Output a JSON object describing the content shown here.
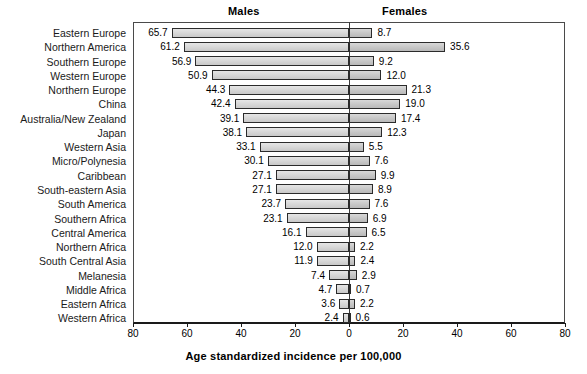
{
  "header": {
    "males_label": "Males",
    "females_label": "Females"
  },
  "axis": {
    "title": "Age standardized incidence per 100,000",
    "ticks": [
      "80",
      "60",
      "40",
      "20",
      "0",
      "20",
      "40",
      "60",
      "80"
    ]
  },
  "chart_data": {
    "type": "bar",
    "subtype": "population-pyramid",
    "title": "",
    "xlabel": "Age standardized incidence per 100,000",
    "ylabel": "",
    "xlim": [
      -80,
      80
    ],
    "grid": false,
    "legend": [
      "Males",
      "Females"
    ],
    "legend_position": "top",
    "categories": [
      "Eastern Europe",
      "Northern America",
      "Southern Europe",
      "Western Europe",
      "Northern Europe",
      "China",
      "Australia/New Zealand",
      "Japan",
      "Western Asia",
      "Micro/Polynesia",
      "Caribbean",
      "South-eastern Asia",
      "South America",
      "Southern Africa",
      "Central America",
      "Northern Africa",
      "South Central Asia",
      "Melanesia",
      "Middle Africa",
      "Eastern Africa",
      "Western Africa"
    ],
    "series": [
      {
        "name": "Males",
        "direction": "left",
        "values": [
          65.7,
          61.2,
          56.9,
          50.9,
          44.3,
          42.4,
          39.1,
          38.1,
          33.1,
          30.1,
          27.1,
          27.1,
          23.7,
          23.1,
          16.1,
          12.0,
          11.9,
          7.4,
          4.7,
          3.6,
          2.4
        ],
        "labels": [
          "65.7",
          "61.2",
          "56.9",
          "50.9",
          "44.3",
          "42.4",
          "39.1",
          "38.1",
          "33.1",
          "30.1",
          "27.1",
          "27.1",
          "23.7",
          "23.1",
          "16.1",
          "12.0",
          "11.9",
          "7.4",
          "4.7",
          "3.6",
          "2.4"
        ]
      },
      {
        "name": "Females",
        "direction": "right",
        "values": [
          8.7,
          35.6,
          9.2,
          12.0,
          21.3,
          19.0,
          17.4,
          12.3,
          5.5,
          7.6,
          9.9,
          8.9,
          7.6,
          6.9,
          6.5,
          2.2,
          2.4,
          2.9,
          0.7,
          2.2,
          0.6
        ],
        "labels": [
          "8.7",
          "35.6",
          "9.2",
          "12.0",
          "21.3",
          "19.0",
          "17.4",
          "12.3",
          "5.5",
          "7.6",
          "9.9",
          "8.9",
          "7.6",
          "6.9",
          "6.5",
          "2.2",
          "2.4",
          "2.9",
          "0.7",
          "2.2",
          "0.6"
        ]
      }
    ]
  }
}
